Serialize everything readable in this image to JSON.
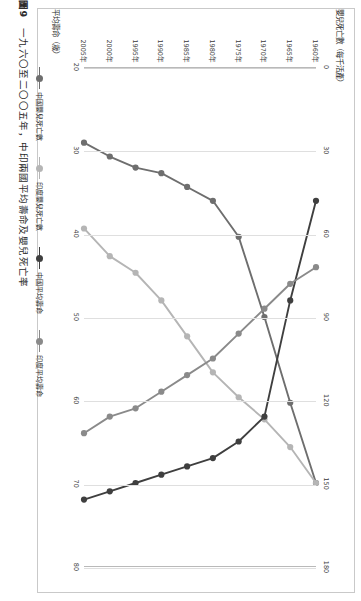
{
  "figure": {
    "number": "圖9",
    "caption": "一九六〇至二〇〇五年，中印兩國平均壽命及嬰兒死亡率"
  },
  "axes": {
    "top_title": "嬰兒死亡數（每千活產）",
    "bottom_title": "平均壽命（歲）",
    "top_ticks": [
      "0",
      "30",
      "60",
      "90",
      "120",
      "150",
      "180"
    ],
    "bottom_ticks": [
      "20",
      "30",
      "40",
      "50",
      "60",
      "70",
      "80"
    ],
    "year_ticks": [
      "1960年",
      "1965年",
      "1970年",
      "1975年",
      "1980年",
      "1985年",
      "1990年",
      "1995年",
      "2000年",
      "2005年"
    ]
  },
  "legend": {
    "items": [
      {
        "label": "中國嬰兒死亡數",
        "color": "#6e6e6e"
      },
      {
        "label": "印度嬰兒死亡數",
        "color": "#b5b5b5"
      },
      {
        "label": "中國平均壽命",
        "color": "#3f3f3f"
      },
      {
        "label": "印度平均壽命",
        "color": "#8a8a8a"
      }
    ]
  },
  "chart_data": {
    "type": "line",
    "title": "一九六〇至二〇〇五年，中印兩國平均壽命及嬰兒死亡率",
    "xlabel": "年份",
    "ylabel": "嬰兒死亡數（每千活產）",
    "ylabel2": "平均壽命（歲）",
    "grid": true,
    "legend_position": "bottom",
    "categories": [
      "1960年",
      "1965年",
      "1970年",
      "1975年",
      "1980年",
      "1985年",
      "1990年",
      "1995年",
      "2000年",
      "2005年"
    ],
    "mortality_axis": {
      "label": "嬰兒死亡數（每千活產）",
      "ticks": [
        0,
        30,
        60,
        90,
        120,
        150,
        180
      ],
      "lim": [
        0,
        180
      ]
    },
    "life_axis": {
      "label": "平均壽命（歲）",
      "ticks": [
        20,
        30,
        40,
        50,
        60,
        70,
        80
      ],
      "lim": [
        20,
        80
      ]
    },
    "series": [
      {
        "name": "中國嬰兒死亡數",
        "axis": "mortality",
        "color": "#6e6e6e",
        "values": [
          150,
          121,
          90,
          61,
          48,
          43,
          38,
          36,
          32,
          27
        ]
      },
      {
        "name": "印度嬰兒死亡數",
        "axis": "mortality",
        "color": "#b5b5b5",
        "values": [
          150,
          137,
          127,
          119,
          110,
          97,
          84,
          74,
          68,
          58
        ]
      },
      {
        "name": "中國平均壽命",
        "axis": "life",
        "color": "#3f3f3f",
        "values": [
          36,
          48,
          62,
          65,
          67,
          68,
          69,
          70,
          71,
          72
        ]
      },
      {
        "name": "印度平均壽命",
        "axis": "life",
        "color": "#8a8a8a",
        "values": [
          44,
          46,
          49,
          52,
          55,
          57,
          59,
          61,
          62,
          64
        ]
      }
    ]
  }
}
